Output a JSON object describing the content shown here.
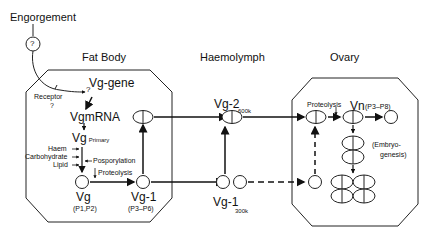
{
  "top": {
    "trigger": "Engorgement",
    "unknown_symbol": "?"
  },
  "compartments": {
    "fat_body": {
      "title": "Fat Body"
    },
    "haemolymph": {
      "title": "Haemolymph"
    },
    "ovary": {
      "title": "Ovary"
    }
  },
  "fat_body": {
    "receptor": "Receptor",
    "receptor_q": "?",
    "gene_q": "?",
    "gene": "Vg-gene",
    "mrna": "VgmRNA",
    "vg_primary_main": "Vg",
    "vg_primary_sub": "Primary",
    "modifiers": [
      "Haem",
      "Carbohydrate",
      "Lipid"
    ],
    "phosphorylation": "Posporylation",
    "proteolysis": "Proteolysis",
    "vg_label": "Vg",
    "vg_sub": "(P1,P2)",
    "vg1_label": "Vg-1",
    "vg1_sub": "(P3–P6)"
  },
  "haemolymph": {
    "vg2_label": "Vg-2",
    "vg2_size": "600k",
    "vg1_label": "Vg-1",
    "vg1_size": "300k"
  },
  "ovary": {
    "proteolysis": "Proteolysis",
    "vn_label": "Vn",
    "vn_sub": "(P3–P8)",
    "embryo_line1": "(Embryo-",
    "embryo_line2": "genesis)"
  }
}
